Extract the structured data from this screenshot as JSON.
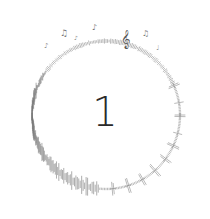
{
  "numeral": "1",
  "ring": {
    "center": [
      106,
      115
    ],
    "radius": 74,
    "color": "#888888",
    "top_motif": "music-notes",
    "bottom_motif": "audio-waveform"
  },
  "colors": {
    "background": "#ffffff",
    "numeral": "#2a2a2a",
    "ink": "#7a7a7a"
  }
}
